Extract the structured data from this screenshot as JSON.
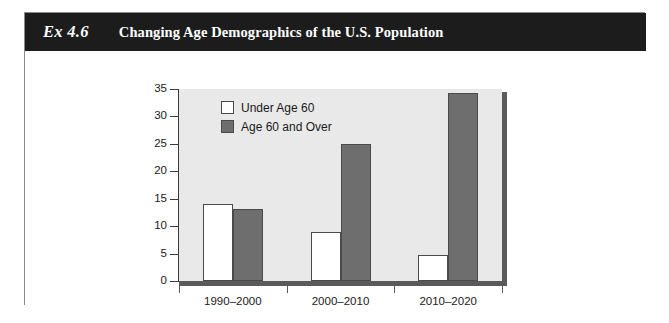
{
  "exhibit": {
    "number": "Ex 4.6",
    "title": "Changing Age Demographics of the U.S. Population"
  },
  "chart_data": {
    "type": "bar",
    "title": "Changing Age Demographics of the U.S. Population",
    "xlabel": "",
    "ylabel": "",
    "categories": [
      "1990–2000",
      "2000–2010",
      "2010–2020"
    ],
    "series": [
      {
        "name": "Under Age 60",
        "color": "#ffffff",
        "values": [
          14.1,
          8.9,
          4.8
        ]
      },
      {
        "name": "Age 60 and Over",
        "color": "#6e6e6e",
        "values": [
          13.2,
          24.9,
          34.3
        ]
      }
    ],
    "ylim": [
      0,
      35
    ],
    "yticks": [
      "0",
      "5",
      "10",
      "15",
      "20",
      "25",
      "30",
      "35"
    ],
    "ytick_values": [
      0,
      5,
      10,
      15,
      20,
      25,
      30,
      35
    ],
    "grid": false,
    "legend_position": "top-left-inside",
    "plot_background": "#e9e9e9"
  }
}
